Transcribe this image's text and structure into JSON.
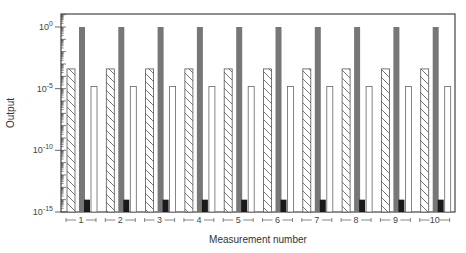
{
  "chart_data": {
    "type": "bar",
    "title": "",
    "xlabel": "Measurement number",
    "ylabel": "Output",
    "yscale": "log",
    "ylim": [
      1e-15,
      10
    ],
    "yticks": [
      {
        "exp": "0",
        "value": 1
      },
      {
        "exp": "-5",
        "value": 1e-05
      },
      {
        "exp": "-10",
        "value": 1e-10
      },
      {
        "exp": "-15",
        "value": 1e-15
      }
    ],
    "categories": [
      "1",
      "2",
      "3",
      "4",
      "5",
      "6",
      "7",
      "8",
      "9",
      "10"
    ],
    "series": [
      {
        "name": "hatched",
        "style": "hatched",
        "values": [
          0.0004,
          0.0004,
          0.0004,
          0.0004,
          0.0004,
          0.0004,
          0.0004,
          0.0004,
          0.0004,
          0.0004
        ]
      },
      {
        "name": "gray",
        "style": "gray",
        "color": "#777777",
        "values": [
          1,
          1,
          1,
          1,
          1,
          1,
          1,
          1,
          1,
          1
        ]
      },
      {
        "name": "black",
        "style": "black",
        "color": "#1a1a1a",
        "values": [
          1e-14,
          1e-14,
          1e-14,
          1e-14,
          1e-14,
          1e-14,
          1e-14,
          1e-14,
          1e-14,
          1e-14
        ]
      },
      {
        "name": "white",
        "style": "white",
        "color": "#ffffff",
        "values": [
          1.5e-05,
          1.5e-05,
          1.5e-05,
          1.5e-05,
          1.5e-05,
          1.5e-05,
          1.5e-05,
          1.5e-05,
          1.5e-05,
          1.5e-05
        ]
      }
    ],
    "grid": false,
    "legend": null
  },
  "labels": {
    "y_base": "10",
    "xlabel": "Measurement number",
    "ylabel": "Output"
  }
}
